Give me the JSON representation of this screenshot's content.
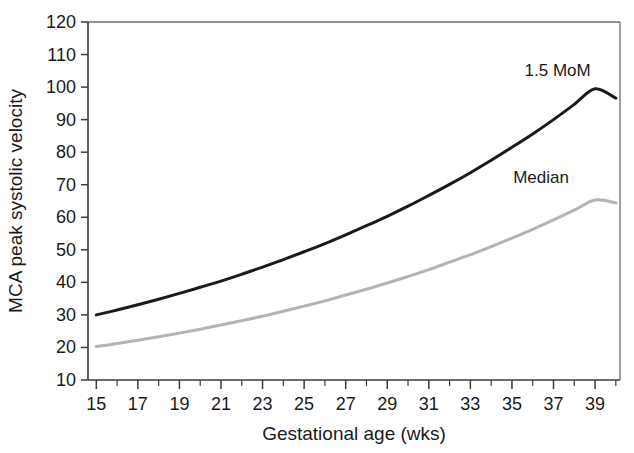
{
  "chart_data": {
    "type": "line",
    "title": "",
    "xlabel": "Gestational age (wks)",
    "ylabel": "MCA peak systolic velocity",
    "xlim": [
      14.6,
      40.2
    ],
    "ylim": [
      10,
      120
    ],
    "grid": false,
    "legend_position": "inline-right",
    "xticks": [
      15,
      17,
      19,
      21,
      23,
      25,
      27,
      29,
      31,
      33,
      35,
      37,
      39
    ],
    "xtick_labels": [
      "15",
      "17",
      "19",
      "21",
      "23",
      "25",
      "27",
      "29",
      "31",
      "33",
      "35",
      "37",
      "39"
    ],
    "xminor_ticks": [
      16,
      18,
      20,
      22,
      24,
      26,
      28,
      30,
      32,
      34,
      36,
      38,
      40
    ],
    "yticks": [
      10,
      20,
      30,
      40,
      50,
      60,
      70,
      80,
      90,
      100,
      110,
      120
    ],
    "ytick_labels": [
      "10",
      "20",
      "30",
      "40",
      "50",
      "60",
      "70",
      "80",
      "90",
      "100",
      "110",
      "120"
    ],
    "x": [
      15,
      16,
      17,
      18,
      19,
      20,
      21,
      22,
      23,
      24,
      25,
      26,
      27,
      28,
      29,
      30,
      31,
      32,
      33,
      34,
      35,
      36,
      37,
      38,
      39,
      40
    ],
    "series": [
      {
        "name": "1.5 MoM",
        "color": "#1a1a1a",
        "line_width": 3.0,
        "label_x": 37.2,
        "label_y": 103.5,
        "values": [
          30.0,
          31.5,
          33.1,
          34.8,
          36.6,
          38.5,
          40.4,
          42.5,
          44.7,
          47.0,
          49.4,
          51.9,
          54.6,
          57.4,
          60.3,
          63.4,
          66.7,
          70.1,
          73.7,
          77.5,
          81.5,
          85.6,
          90.0,
          94.7,
          99.5,
          96.6
        ]
      },
      {
        "name": "Median",
        "color": "#b4b4b4",
        "line_width": 3.0,
        "label_x": 36.4,
        "label_y": 70.5,
        "values": [
          20.3,
          21.2,
          22.2,
          23.3,
          24.4,
          25.6,
          26.9,
          28.2,
          29.6,
          31.1,
          32.7,
          34.3,
          36.1,
          37.9,
          39.8,
          41.8,
          43.9,
          46.2,
          48.5,
          51.0,
          53.6,
          56.3,
          59.2,
          62.2,
          65.3,
          64.4
        ]
      }
    ],
    "curves_fit": {
      "median": {
        "start_value": 20.3,
        "end_value": 64.4
      },
      "one_point_five_mom": {
        "start_value": 30.0,
        "end_value": 96.6
      }
    }
  }
}
